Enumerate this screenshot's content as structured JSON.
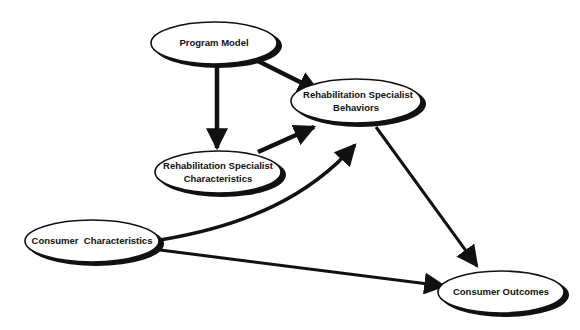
{
  "diagram": {
    "type": "path-model",
    "nodes": [
      {
        "id": "program_model",
        "label_lines": [
          "Program Model"
        ]
      },
      {
        "id": "rs_behaviors",
        "label_lines": [
          "Rehabilitation Specialist",
          "Behaviors"
        ]
      },
      {
        "id": "rs_characteristics",
        "label_lines": [
          "Rehabilitation Specialist",
          "Characteristics"
        ]
      },
      {
        "id": "consumer_characteristics",
        "label_lines": [
          "Consumer  Characteristics"
        ]
      },
      {
        "id": "consumer_outcomes",
        "label_lines": [
          "Consumer Outcomes"
        ]
      }
    ],
    "edges": [
      {
        "from": "program_model",
        "to": "rs_behaviors"
      },
      {
        "from": "program_model",
        "to": "rs_characteristics"
      },
      {
        "from": "rs_characteristics",
        "to": "rs_behaviors"
      },
      {
        "from": "consumer_characteristics",
        "to": "rs_behaviors",
        "curved": true
      },
      {
        "from": "consumer_characteristics",
        "to": "consumer_outcomes"
      },
      {
        "from": "rs_behaviors",
        "to": "consumer_outcomes"
      }
    ]
  }
}
